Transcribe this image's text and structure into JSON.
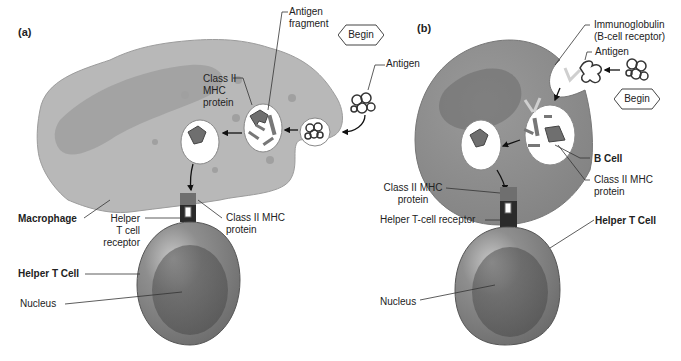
{
  "panels": {
    "a": {
      "label": "(a)",
      "labels": {
        "antigen_fragment": [
          "Antigen",
          "fragment"
        ],
        "begin": "Begin",
        "antigen": "Antigen",
        "class2_mhc_inner": [
          "Class II",
          "MHC",
          "protein"
        ],
        "macrophage": "Macrophage",
        "helper_t_receptor": [
          "Helper",
          "T cell",
          "receptor"
        ],
        "class2_mhc_outer": [
          "Class II MHC",
          "protein"
        ],
        "helper_t_cell": "Helper T Cell",
        "nucleus": "Nucleus"
      }
    },
    "b": {
      "label": "(b)",
      "labels": {
        "immunoglobulin": [
          "Immunoglobulin",
          "(B-cell receptor)"
        ],
        "antigen": "Antigen",
        "begin": "Begin",
        "b_cell": "B Cell",
        "class2_mhc_right": [
          "Class II MHC",
          "protein"
        ],
        "class2_mhc_left": [
          "Class II MHC",
          "protein"
        ],
        "helper_t_receptor": "Helper T-cell receptor",
        "helper_t_cell": "Helper T Cell",
        "nucleus": "Nucleus"
      }
    }
  },
  "colors": {
    "cell_fill": "#b5b5b5",
    "cell_dark": "#8a8a8a",
    "vesicle": "#ffffff",
    "mhc": "#6f6f6f",
    "receptor": "#2b2b2b",
    "tcell": "#8c8c8c",
    "tcell_nucleus": "#5f5f5f"
  }
}
